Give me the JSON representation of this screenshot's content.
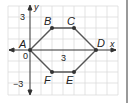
{
  "axes": {
    "x_label": "x",
    "y_label": "y",
    "origin_label": "0"
  },
  "tick_labels": {
    "x3": "3",
    "y3": "3",
    "yneg3": "−3"
  },
  "points": [
    {
      "label": "A",
      "x": 0,
      "y": 0
    },
    {
      "label": "B",
      "x": 2,
      "y": 2
    },
    {
      "label": "C",
      "x": 4,
      "y": 2
    },
    {
      "label": "D",
      "x": 6,
      "y": 0
    },
    {
      "label": "E",
      "x": 4,
      "y": -2
    },
    {
      "label": "F",
      "x": 2,
      "y": -2
    }
  ],
  "colors": {
    "grid": "#dcdcdc",
    "lines": "#555555",
    "points": "#333333",
    "axes": "#333333",
    "side_bar": "#9a9a9a"
  }
}
